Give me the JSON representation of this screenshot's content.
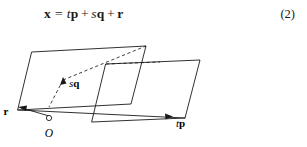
{
  "equation": {
    "lhs": "x",
    "equals": "=",
    "term1_scalar": "t",
    "term1_vector": "p",
    "plus1": "+",
    "term2_scalar": "s",
    "term2_vector": "q",
    "plus2": "+",
    "term3_vector": "r",
    "number": "(2)"
  },
  "figure": {
    "label_r": "r",
    "label_sq_scalar": "s",
    "label_sq_vector": "q",
    "label_tp_scalar": "t",
    "label_tp_vector": "p",
    "label_origin": "O",
    "colors": {
      "stroke": "#1a1a1a",
      "background": "#ffffff"
    }
  }
}
